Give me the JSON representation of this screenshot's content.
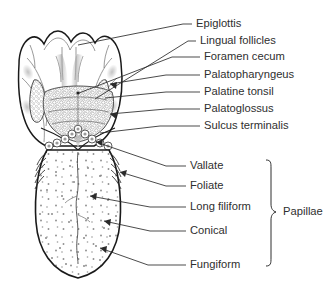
{
  "figure": {
    "background_color": "#ffffff",
    "line_color": "#1a1a1a",
    "text_color": "#2f2f2f"
  },
  "labels": {
    "upper": [
      {
        "id": "epiglottis",
        "text": "Epiglottis",
        "x": 196,
        "y": 24
      },
      {
        "id": "lingual-follicles",
        "text": "Lingual follicles",
        "x": 200,
        "y": 41
      },
      {
        "id": "foramen-cecum",
        "text": "Foramen cecum",
        "x": 204,
        "y": 57
      },
      {
        "id": "palatopharyngeus",
        "text": "Palatopharyngeus",
        "x": 204,
        "y": 75
      },
      {
        "id": "palatine-tonsil",
        "text": "Palatine tonsil",
        "x": 204,
        "y": 92
      },
      {
        "id": "palatoglossus",
        "text": "Palatoglossus",
        "x": 204,
        "y": 109
      },
      {
        "id": "sulcus-terminalis",
        "text": "Sulcus terminalis",
        "x": 204,
        "y": 126
      }
    ],
    "lower": [
      {
        "id": "vallate",
        "text": "Vallate",
        "x": 190,
        "y": 166
      },
      {
        "id": "foliate",
        "text": "Foliate",
        "x": 190,
        "y": 186
      },
      {
        "id": "long-filiform",
        "text": "Long filiform",
        "x": 190,
        "y": 207
      },
      {
        "id": "conical",
        "text": "Conical",
        "x": 190,
        "y": 231
      },
      {
        "id": "fungiform",
        "text": "Fungiform",
        "x": 190,
        "y": 265
      }
    ],
    "group": {
      "id": "papillae",
      "text": "Papillae",
      "x": 283,
      "y": 212
    }
  }
}
